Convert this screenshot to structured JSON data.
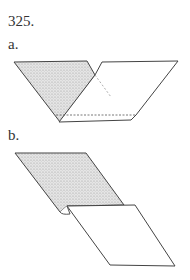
{
  "figure": {
    "number": "325.",
    "step_a_label": "a.",
    "step_b_label": "b."
  },
  "colors": {
    "line": "#444444",
    "shading": "#c8c8c8",
    "paper": "#ffffff"
  }
}
